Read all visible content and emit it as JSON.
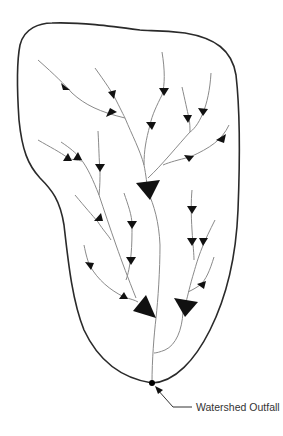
{
  "diagram": {
    "outfall_label": "Watershed Outfall",
    "elements": {
      "boundary": "watershed-boundary",
      "streams": "drainage-streams",
      "flow_arrows": "flow-direction-arrows",
      "outfall": "outfall-point"
    },
    "colors": {
      "boundary": "#2a2a2a",
      "stream": "#8a8a8a",
      "arrow": "#111111",
      "label": "#333333"
    }
  }
}
